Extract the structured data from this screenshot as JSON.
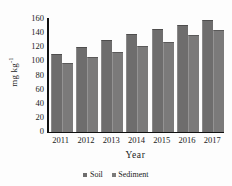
{
  "chart_data": {
    "type": "bar",
    "title": "",
    "xlabel": "Year",
    "ylabel": "mg kg",
    "ylabel_sup": "-1",
    "categories": [
      "2011",
      "2012",
      "2013",
      "2014",
      "2015",
      "2016",
      "2017"
    ],
    "series": [
      {
        "name": "Soil",
        "values": [
          109,
          118,
          128,
          137,
          144,
          150,
          157
        ],
        "color": "#6e6d6d"
      },
      {
        "name": "Sediment",
        "values": [
          96,
          105,
          112,
          120,
          126,
          136,
          143
        ],
        "color": "#7b7a7a"
      }
    ],
    "ylim": [
      0,
      160
    ],
    "yticks": [
      0,
      20,
      40,
      60,
      80,
      100,
      120,
      140,
      160
    ],
    "ytick_labels": [
      "0",
      "20",
      "40",
      "60",
      "80",
      "100",
      "120",
      "140",
      "160"
    ],
    "grid": false,
    "legend_position": "bottom"
  },
  "legend": {
    "items": [
      {
        "label": "Soil",
        "marker": "square-marker"
      },
      {
        "label": "Sediment",
        "marker": "square-marker"
      }
    ]
  },
  "axes": {
    "x_title": "Year",
    "y_title_main": "mg kg",
    "y_title_exponent": "-1"
  }
}
